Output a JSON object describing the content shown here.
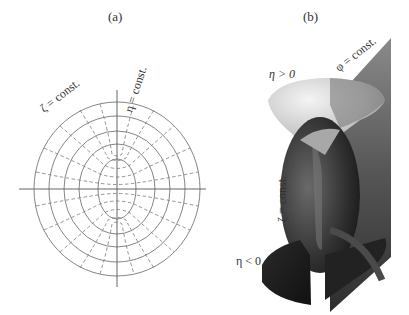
{
  "figure": {
    "panels": [
      {
        "id": "a",
        "caption": "(a)",
        "type": "2D cross-section of prolate spheroidal coordinates",
        "labels": {
          "zeta": "ζ = const.",
          "eta": "η = const."
        },
        "solid_curves": "ellipses (ζ = const.)",
        "dashed_curves": "hyperbolae (η = const.)",
        "ellipse_count": 5
      },
      {
        "id": "b",
        "caption": "(b)",
        "type": "3D coordinate surfaces",
        "labels": {
          "eta_pos": "η > 0",
          "phi": "φ = const.",
          "zeta": "ζ = const.",
          "eta_neg": "η < 0"
        }
      }
    ]
  }
}
